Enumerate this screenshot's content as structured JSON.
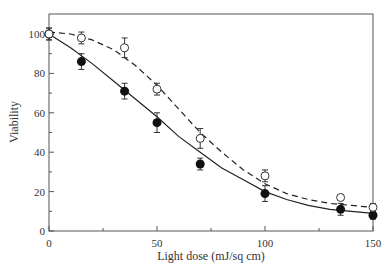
{
  "chart_data": {
    "type": "line",
    "title": "",
    "xlabel": "Light dose (mJ/sq cm)",
    "ylabel": "Viability",
    "xlim": [
      0,
      150
    ],
    "ylim": [
      0,
      110
    ],
    "x_ticks": [
      0,
      50,
      100,
      150
    ],
    "y_ticks": [
      0,
      20,
      40,
      60,
      80,
      100
    ],
    "grid": false,
    "legend": null,
    "series": [
      {
        "name": "filled circles (solid fit)",
        "marker": "filled-circle",
        "line": "solid",
        "x": [
          0,
          15,
          35,
          50,
          70,
          100,
          135,
          150
        ],
        "y": [
          100,
          86,
          71,
          55,
          34,
          19,
          11,
          8
        ],
        "err": [
          3,
          4,
          4,
          5,
          3,
          4,
          3,
          2
        ]
      },
      {
        "name": "open circles (dashed fit)",
        "marker": "open-circle",
        "line": "dashed",
        "x": [
          0,
          15,
          35,
          50,
          70,
          100,
          135,
          150
        ],
        "y": [
          100,
          98,
          93,
          72,
          47,
          28,
          17,
          12
        ],
        "err": [
          3,
          3,
          5,
          3,
          5,
          3,
          1,
          2
        ]
      }
    ],
    "fit_curves": {
      "solid": {
        "x": [
          0,
          10,
          20,
          30,
          40,
          50,
          60,
          70,
          80,
          90,
          100,
          110,
          120,
          130,
          140,
          150
        ],
        "y": [
          100,
          93,
          85,
          76,
          67,
          58,
          48,
          40,
          32,
          26,
          20,
          16,
          13,
          11,
          10,
          9
        ]
      },
      "dashed": {
        "x": [
          0,
          10,
          20,
          30,
          40,
          50,
          60,
          70,
          80,
          90,
          100,
          110,
          120,
          130,
          140,
          150
        ],
        "y": [
          101,
          100,
          97,
          92,
          84,
          74,
          62,
          50,
          40,
          31,
          24,
          19,
          16,
          14,
          13,
          12
        ]
      }
    }
  }
}
